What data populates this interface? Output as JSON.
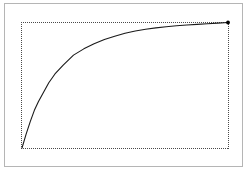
{
  "figure": {
    "title": "",
    "background_color": "#ffffff",
    "frame_color": "#b5b5b5",
    "plot_border_style": "dotted",
    "plot_border_color": "#4a4a4a",
    "curve_color": "#1a1a1a",
    "endpoint_marker_color": "#000000"
  },
  "chart_data": {
    "type": "line",
    "title": "",
    "xlabel": "",
    "ylabel": "",
    "xlim": [
      0,
      1
    ],
    "ylim": [
      0,
      1
    ],
    "grid": false,
    "legend": null,
    "axis_ticks_visible": false,
    "x": [
      0.0,
      0.02,
      0.04,
      0.06,
      0.08,
      0.1,
      0.13,
      0.16,
      0.2,
      0.25,
      0.3,
      0.35,
      0.4,
      0.45,
      0.5,
      0.55,
      0.6,
      0.65,
      0.7,
      0.75,
      0.8,
      0.85,
      0.9,
      0.95,
      1.0
    ],
    "y": [
      0.0,
      0.11,
      0.21,
      0.3,
      0.37,
      0.43,
      0.52,
      0.59,
      0.66,
      0.74,
      0.79,
      0.83,
      0.865,
      0.89,
      0.915,
      0.932,
      0.946,
      0.957,
      0.966,
      0.974,
      0.98,
      0.985,
      0.99,
      0.995,
      1.0
    ],
    "series": [
      {
        "name": "saturation-curve",
        "values": [
          0.0,
          0.11,
          0.21,
          0.3,
          0.37,
          0.43,
          0.52,
          0.59,
          0.66,
          0.74,
          0.79,
          0.83,
          0.865,
          0.89,
          0.915,
          0.932,
          0.946,
          0.957,
          0.966,
          0.974,
          0.98,
          0.985,
          0.99,
          0.995,
          1.0
        ]
      }
    ],
    "annotations": [
      {
        "name": "endpoint-marker",
        "x": 1.0,
        "y": 1.0,
        "label": ""
      }
    ]
  }
}
